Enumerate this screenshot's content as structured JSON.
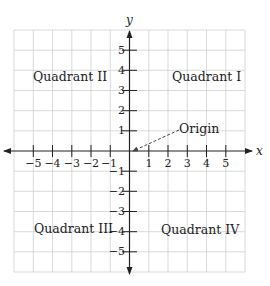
{
  "diagram": {
    "type": "cartesian-coordinate-plane",
    "axes": {
      "x_label": "x",
      "y_label": "y",
      "x_range": [
        -6,
        6
      ],
      "y_range": [
        -6,
        6
      ],
      "x_ticks": [
        "−5",
        "−4",
        "−3",
        "−2",
        "−1",
        "1",
        "2",
        "3",
        "4",
        "5"
      ],
      "y_ticks": [
        "5",
        "4",
        "3",
        "2",
        "1",
        "−1",
        "−2",
        "−3",
        "−4",
        "−5"
      ]
    },
    "quadrants": {
      "q1": "Quadrant I",
      "q2": "Quadrant II",
      "q3": "Quadrant III",
      "q4": "Quadrant IV"
    },
    "annotation": {
      "label": "Origin",
      "points_to": [
        0,
        0
      ],
      "leader_style": "dashed-arrow"
    },
    "colors": {
      "grid": "#cfcfcf",
      "axis": "#222222",
      "text": "#222222",
      "background": "#ffffff"
    }
  }
}
